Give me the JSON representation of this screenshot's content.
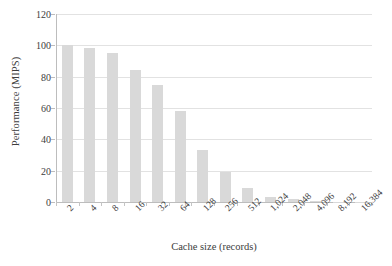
{
  "chart_data": {
    "type": "bar",
    "title": "",
    "subtitle": "",
    "xlabel": "Cache size (records)",
    "ylabel": "Performance (MIPS)",
    "categories": [
      "2",
      "4",
      "8",
      "16",
      "32",
      "64",
      "128",
      "256",
      "512",
      "1,024",
      "2,048",
      "4,096",
      "8,192",
      "16,384"
    ],
    "values": [
      100,
      98,
      95,
      84,
      74.5,
      58,
      33,
      19,
      9,
      3,
      1.8,
      0.8,
      0.3,
      0.1
    ],
    "ylim": [
      0,
      120
    ],
    "ytick_labels": [
      "0",
      "20",
      "40",
      "60",
      "80",
      "100",
      "120"
    ],
    "ytick_values": [
      0,
      20,
      40,
      60,
      80,
      100,
      120
    ],
    "grid": true,
    "grid_axis": "y",
    "legend": false,
    "legend_position": "none",
    "bar_color": "#d9d9d9",
    "gridline_color": "#e2e2e2",
    "axis_color": "#bdbdbd",
    "text_color": "#3d3d3d",
    "xtick_label_rotation": -45
  }
}
